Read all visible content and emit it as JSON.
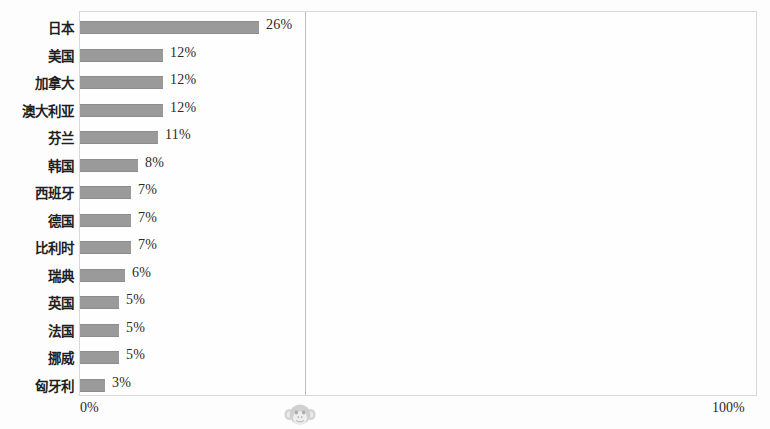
{
  "chart_data": {
    "type": "bar",
    "orientation": "horizontal",
    "title": "",
    "subtitle": "",
    "xlabel": "",
    "ylabel": "",
    "xlim": [
      0,
      100
    ],
    "x_tick_labels": [
      "0%",
      "100%"
    ],
    "grid": true,
    "gridlines_x": [
      33
    ],
    "legend": null,
    "legend_position": "none",
    "bar_color": "#9a9a9a",
    "categories": [
      "日本",
      "美国",
      "加拿大",
      "澳大利亚",
      "芬兰",
      "韩国",
      "西班牙",
      "德国",
      "比利时",
      "瑞典",
      "英国",
      "法国",
      "挪威",
      "匈牙利"
    ],
    "values": [
      26,
      12,
      12,
      12,
      11,
      8,
      7,
      7,
      7,
      6,
      5,
      5,
      5,
      3
    ],
    "data_labels": [
      "26%",
      "12%",
      "12%",
      "12%",
      "11%",
      "8%",
      "7%",
      "7%",
      "7%",
      "6%",
      "5%",
      "5%",
      "5%",
      "3%"
    ],
    "bar_pixel_widths": [
      179,
      83,
      83,
      83,
      78,
      58,
      51,
      51,
      51,
      45,
      39,
      39,
      39,
      25
    ]
  },
  "axis": {
    "min_label": "0%",
    "max_label": "100%"
  },
  "watermark": {
    "icon": "monkey-face-icon"
  }
}
